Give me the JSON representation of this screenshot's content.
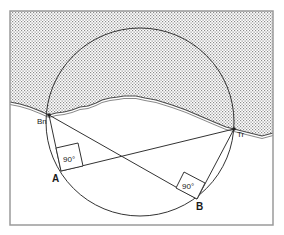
{
  "diagram": {
    "type": "geometry-survey",
    "colors": {
      "frame": "#9a9a9a",
      "line": "#333333",
      "water_dots": "#8c8c8c",
      "background": "#ffffff"
    },
    "points": {
      "Bn": {
        "label": "Bn",
        "x": 49,
        "y": 115
      },
      "Tr": {
        "label": "Tr",
        "x": 234,
        "y": 129
      },
      "A": {
        "label": "A",
        "x": 61,
        "y": 171
      },
      "B": {
        "label": "B",
        "x": 197,
        "y": 199
      }
    },
    "circle": {
      "cx": 140,
      "cy": 122,
      "r": 94
    },
    "angles": [
      {
        "at": "A",
        "label": "90°"
      },
      {
        "at": "B",
        "label": "90°"
      }
    ]
  }
}
